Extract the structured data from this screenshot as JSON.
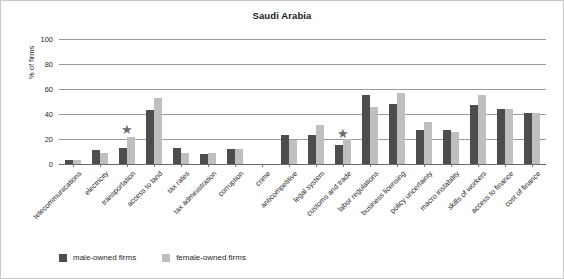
{
  "chart_data": {
    "type": "bar",
    "title": "Saudi Arabia",
    "xlabel": "",
    "ylabel": "% of firms",
    "ylim": [
      0,
      100
    ],
    "yticks": [
      0,
      20,
      40,
      60,
      80,
      100
    ],
    "grid": true,
    "legend_position": "bottom-left",
    "categories": [
      "telecommunications",
      "electricity",
      "transportation",
      "access to land",
      "tax rates",
      "tax administration",
      "corruption",
      "crime",
      "anticompetitive",
      "legal system",
      "customs and trade",
      "labor regulations",
      "business licensing",
      "policy uncertainty",
      "macro instability",
      "skills of workers",
      "access to finance",
      "cost of finance"
    ],
    "series": [
      {
        "name": "male-owned firms",
        "color": "#4d4d4d",
        "values": [
          3,
          11,
          13,
          43,
          13,
          8,
          12,
          0,
          23,
          23,
          15,
          55,
          48,
          27,
          27,
          47,
          44,
          41
        ]
      },
      {
        "name": "female-owned firms",
        "color": "#bfbfbf",
        "values": [
          3,
          9,
          22,
          53,
          9,
          9,
          12,
          0,
          19,
          31,
          20,
          46,
          57,
          34,
          26,
          55,
          44,
          41
        ]
      }
    ],
    "annotations": [
      {
        "marker": "star",
        "category": "transportation",
        "value": 28
      },
      {
        "marker": "star",
        "category": "customs and trade",
        "value": 25
      }
    ]
  },
  "legend": {
    "items": [
      {
        "label": "male-owned firms",
        "color": "#4d4d4d"
      },
      {
        "label": "female-owned firms",
        "color": "#bfbfbf"
      }
    ]
  }
}
